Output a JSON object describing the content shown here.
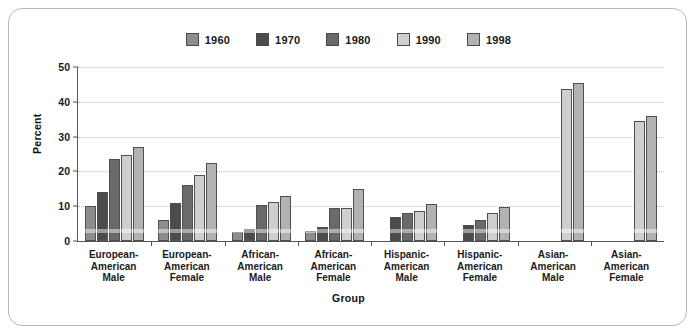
{
  "chart_data": {
    "type": "bar",
    "title": "",
    "xlabel": "Group",
    "ylabel": "Percent",
    "ylim": [
      0,
      50
    ],
    "yticks": [
      0,
      10,
      20,
      30,
      40,
      50
    ],
    "grid": true,
    "legend_position": "top-center",
    "categories": [
      "European-American Male",
      "European-American Female",
      "African-American Male",
      "African-American Female",
      "Hispanic-American Male",
      "Hispanic-American Female",
      "Asian-American Male",
      "Asian-American Female"
    ],
    "category_lines": [
      [
        "European-",
        "American",
        "Male"
      ],
      [
        "European-",
        "American",
        "Female"
      ],
      [
        "African-",
        "American",
        "Male"
      ],
      [
        "African-",
        "American",
        "Female"
      ],
      [
        "Hispanic-",
        "American",
        "Male"
      ],
      [
        "Hispanic-",
        "American",
        "Female"
      ],
      [
        "Asian-",
        "American",
        "Male"
      ],
      [
        "Asian-",
        "American",
        "Female"
      ]
    ],
    "series": [
      {
        "name": "1960",
        "color": "#8d8d8d",
        "values": [
          10.0,
          6.0,
          2.5,
          2.8,
          null,
          null,
          null,
          null
        ]
      },
      {
        "name": "1970",
        "color": "#4c4c4c",
        "values": [
          14.2,
          11.0,
          3.5,
          4.0,
          7.0,
          4.6,
          null,
          null
        ]
      },
      {
        "name": "1980",
        "color": "#6a6a6a",
        "values": [
          23.5,
          16.2,
          10.3,
          9.5,
          8.0,
          6.0,
          null,
          null
        ]
      },
      {
        "name": "1990",
        "color": "#cfcfcf",
        "values": [
          24.8,
          19.0,
          11.3,
          9.6,
          8.6,
          8.0,
          43.8,
          34.5
        ]
      },
      {
        "name": "1998",
        "color": "#b2b2b2",
        "values": [
          27.0,
          22.5,
          13.0,
          15.0,
          10.6,
          9.8,
          45.4,
          36.0
        ]
      }
    ]
  },
  "axis": {
    "y_title": "Percent",
    "x_title": "Group",
    "y_tick_labels": [
      "0",
      "10",
      "20",
      "30",
      "40",
      "50"
    ]
  }
}
